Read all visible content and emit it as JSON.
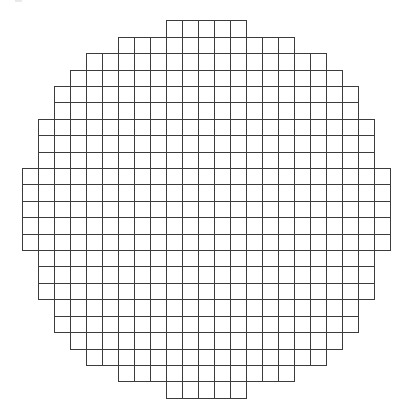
{
  "diagram": {
    "type": "pixelated-circle-grid",
    "background_color": "#ffffff",
    "line_color": "#3c3c3c",
    "columns": 23,
    "rows": 23,
    "origin_x": 21.7,
    "origin_y": 20.3,
    "cell_width": 16.0,
    "cell_height": 16.41,
    "row_spans": [
      {
        "row": 0,
        "start_col": 9,
        "end_col": 13
      },
      {
        "row": 1,
        "start_col": 6,
        "end_col": 16
      },
      {
        "row": 2,
        "start_col": 4,
        "end_col": 18
      },
      {
        "row": 3,
        "start_col": 3,
        "end_col": 19
      },
      {
        "row": 4,
        "start_col": 2,
        "end_col": 20
      },
      {
        "row": 5,
        "start_col": 2,
        "end_col": 20
      },
      {
        "row": 6,
        "start_col": 1,
        "end_col": 21
      },
      {
        "row": 7,
        "start_col": 1,
        "end_col": 21
      },
      {
        "row": 8,
        "start_col": 1,
        "end_col": 21
      },
      {
        "row": 9,
        "start_col": 0,
        "end_col": 22
      },
      {
        "row": 10,
        "start_col": 0,
        "end_col": 22
      },
      {
        "row": 11,
        "start_col": 0,
        "end_col": 22
      },
      {
        "row": 12,
        "start_col": 0,
        "end_col": 22
      },
      {
        "row": 13,
        "start_col": 0,
        "end_col": 22
      },
      {
        "row": 14,
        "start_col": 1,
        "end_col": 21
      },
      {
        "row": 15,
        "start_col": 1,
        "end_col": 21
      },
      {
        "row": 16,
        "start_col": 1,
        "end_col": 21
      },
      {
        "row": 17,
        "start_col": 2,
        "end_col": 20
      },
      {
        "row": 18,
        "start_col": 2,
        "end_col": 20
      },
      {
        "row": 19,
        "start_col": 3,
        "end_col": 19
      },
      {
        "row": 20,
        "start_col": 4,
        "end_col": 18
      },
      {
        "row": 21,
        "start_col": 6,
        "end_col": 16
      },
      {
        "row": 22,
        "start_col": 9,
        "end_col": 13
      }
    ]
  }
}
